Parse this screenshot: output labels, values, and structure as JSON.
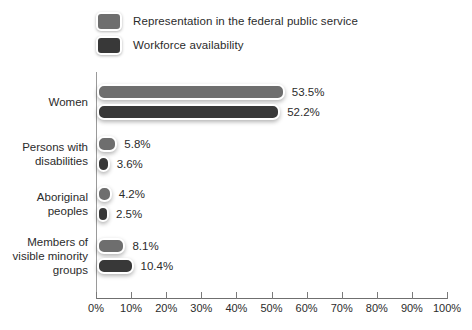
{
  "chart_data": {
    "type": "bar",
    "orientation": "horizontal",
    "title": "",
    "xlabel": "",
    "ylabel": "",
    "xlim": [
      0,
      100
    ],
    "grid": false,
    "legend_position": "top-left",
    "tick_labels": [
      "0%",
      "10%",
      "20%",
      "30%",
      "40%",
      "50%",
      "60%",
      "70%",
      "80%",
      "90%",
      "100%"
    ],
    "tick_values": [
      0,
      10,
      20,
      30,
      40,
      50,
      60,
      70,
      80,
      90,
      100
    ],
    "categories": [
      "Women",
      "Persons with\ndisabilities",
      "Aboriginal\npeoples",
      "Members of\nvisible minority\ngroups"
    ],
    "series": [
      {
        "name": "Representation in the federal public service",
        "color": "#6e6e6e",
        "values": [
          53.5,
          5.8,
          4.2,
          8.1
        ],
        "labels": [
          "53.5%",
          "5.8%",
          "4.2%",
          "8.1%"
        ]
      },
      {
        "name": "Workforce availability",
        "color": "#383838",
        "values": [
          52.2,
          3.6,
          2.5,
          10.4
        ],
        "labels": [
          "52.2%",
          "3.6%",
          "2.5%",
          "10.4%"
        ]
      }
    ]
  },
  "legend": {
    "items": [
      {
        "label": "Representation in the federal public service",
        "color": "#6e6e6e"
      },
      {
        "label": "Workforce availability",
        "color": "#383838"
      }
    ]
  }
}
